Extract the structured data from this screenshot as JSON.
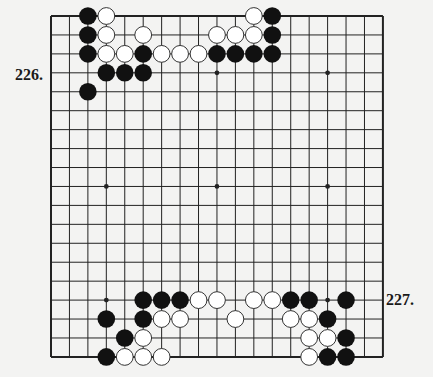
{
  "labels": {
    "problem_top": "226.",
    "problem_bottom": "227."
  },
  "caption": "",
  "board": {
    "size": 19,
    "origin_x": 51,
    "origin_y": 16,
    "spacing_x": 18.44,
    "spacing_y": 18.94,
    "star_points": [
      [
        3,
        3
      ],
      [
        3,
        9
      ],
      [
        3,
        15
      ],
      [
        9,
        3
      ],
      [
        9,
        9
      ],
      [
        9,
        15
      ],
      [
        15,
        3
      ],
      [
        15,
        9
      ],
      [
        15,
        15
      ]
    ],
    "colors": {
      "background": "#f3f3f2",
      "line": "#222222",
      "black_stone": "#111111",
      "white_stone_fill": "#ffffff",
      "white_stone_stroke": "#333333"
    },
    "stones": {
      "black": [
        [
          0,
          2
        ],
        [
          0,
          12
        ],
        [
          1,
          2
        ],
        [
          1,
          12
        ],
        [
          2,
          2
        ],
        [
          2,
          5
        ],
        [
          2,
          9
        ],
        [
          2,
          10
        ],
        [
          2,
          11
        ],
        [
          2,
          12
        ],
        [
          3,
          3
        ],
        [
          3,
          4
        ],
        [
          3,
          5
        ],
        [
          4,
          2
        ],
        [
          15,
          5
        ],
        [
          15,
          6
        ],
        [
          15,
          7
        ],
        [
          15,
          13
        ],
        [
          15,
          14
        ],
        [
          15,
          16
        ],
        [
          16,
          3
        ],
        [
          16,
          5
        ],
        [
          16,
          15
        ],
        [
          17,
          4
        ],
        [
          17,
          16
        ],
        [
          18,
          3
        ],
        [
          18,
          15
        ],
        [
          18,
          16
        ]
      ],
      "white": [
        [
          0,
          3
        ],
        [
          0,
          11
        ],
        [
          1,
          3
        ],
        [
          1,
          5
        ],
        [
          1,
          9
        ],
        [
          1,
          10
        ],
        [
          1,
          11
        ],
        [
          2,
          3
        ],
        [
          2,
          4
        ],
        [
          2,
          6
        ],
        [
          2,
          7
        ],
        [
          2,
          8
        ],
        [
          15,
          8
        ],
        [
          15,
          9
        ],
        [
          15,
          11
        ],
        [
          15,
          12
        ],
        [
          16,
          6
        ],
        [
          16,
          7
        ],
        [
          16,
          10
        ],
        [
          16,
          13
        ],
        [
          16,
          14
        ],
        [
          17,
          5
        ],
        [
          17,
          14
        ],
        [
          17,
          15
        ],
        [
          18,
          4
        ],
        [
          18,
          5
        ],
        [
          18,
          6
        ],
        [
          18,
          14
        ]
      ]
    }
  }
}
